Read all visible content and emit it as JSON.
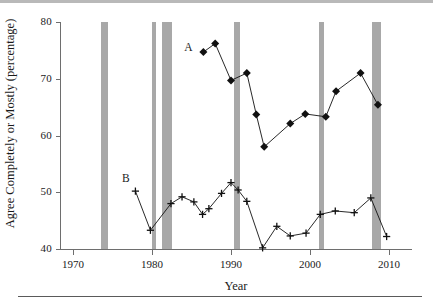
{
  "chart_data": {
    "type": "line",
    "title": "",
    "xlabel": "Year",
    "ylabel": "Agree Completely or Mostly (percentage)",
    "xlim": [
      1970,
      2010
    ],
    "ylim": [
      40,
      80
    ],
    "xticks": [
      1970,
      1980,
      1990,
      2000,
      2010
    ],
    "yticks": [
      40,
      50,
      60,
      70,
      80
    ],
    "grid": false,
    "legend_position": "inline-annotations",
    "annotations": [
      {
        "text": "A",
        "x": 1984.6,
        "y": 75.4
      },
      {
        "text": "B",
        "x": 1976.7,
        "y": 52.3
      }
    ],
    "shaded_bands": {
      "color": "#a8a8a8",
      "label": "recession bands",
      "ranges": [
        [
          1973.5,
          1974.4
        ],
        [
          1980.0,
          1980.5
        ],
        [
          1981.3,
          1982.5
        ],
        [
          1990.4,
          1991.2
        ],
        [
          2001.1,
          2001.8
        ],
        [
          2007.9,
          2009.0
        ]
      ]
    },
    "series": [
      {
        "name": "A",
        "marker": "diamond",
        "color": "#111111",
        "points": [
          {
            "x": 1986.5,
            "y": 74.7
          },
          {
            "x": 1988.0,
            "y": 76.2
          },
          {
            "x": 1990.0,
            "y": 69.7
          },
          {
            "x": 1992.0,
            "y": 71.0
          },
          {
            "x": 1993.2,
            "y": 63.7
          },
          {
            "x": 1994.2,
            "y": 58.0
          },
          {
            "x": 1997.5,
            "y": 62.1
          },
          {
            "x": 1999.4,
            "y": 63.8
          },
          {
            "x": 2002.0,
            "y": 63.3
          },
          {
            "x": 2003.3,
            "y": 67.8
          },
          {
            "x": 2006.4,
            "y": 71.0
          },
          {
            "x": 2008.6,
            "y": 65.4
          }
        ]
      },
      {
        "name": "B",
        "marker": "plus",
        "color": "#111111",
        "points": [
          {
            "x": 1977.9,
            "y": 50.2
          },
          {
            "x": 1979.8,
            "y": 43.3
          },
          {
            "x": 1982.4,
            "y": 48.0
          },
          {
            "x": 1983.8,
            "y": 49.2
          },
          {
            "x": 1985.3,
            "y": 48.3
          },
          {
            "x": 1986.4,
            "y": 46.1
          },
          {
            "x": 1987.2,
            "y": 47.1
          },
          {
            "x": 1988.8,
            "y": 49.8
          },
          {
            "x": 1990.0,
            "y": 51.7
          },
          {
            "x": 1990.9,
            "y": 50.4
          },
          {
            "x": 1992.0,
            "y": 48.4
          },
          {
            "x": 1994.0,
            "y": 40.2
          },
          {
            "x": 1995.8,
            "y": 44.0
          },
          {
            "x": 1997.5,
            "y": 42.3
          },
          {
            "x": 1999.5,
            "y": 42.8
          },
          {
            "x": 2001.3,
            "y": 46.1
          },
          {
            "x": 2003.2,
            "y": 46.7
          },
          {
            "x": 2005.6,
            "y": 46.4
          },
          {
            "x": 2007.7,
            "y": 49.0
          },
          {
            "x": 2009.7,
            "y": 42.2
          }
        ]
      }
    ]
  }
}
